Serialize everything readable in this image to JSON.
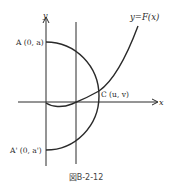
{
  "figure": {
    "caption": "図B-2-12",
    "labels": {
      "y_axis": "y",
      "x_axis": "x",
      "curve": "y=F(x)",
      "point_a": "A (0, a)",
      "point_a_prime": "A' (0, a')",
      "point_c": "C (u, v)"
    },
    "colors": {
      "line": "#2a2a2a",
      "background": "#ffffff"
    }
  }
}
